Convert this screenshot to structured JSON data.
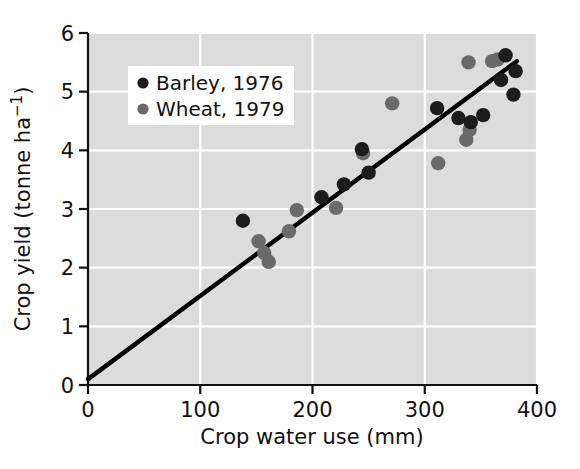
{
  "chart_data": {
    "type": "scatter",
    "title": "",
    "xlabel": "Crop water use (mm)",
    "ylabel": "Crop yield (tonne ha−1)",
    "xlim": [
      0,
      400
    ],
    "ylim": [
      0,
      6
    ],
    "xticks": [
      0,
      100,
      200,
      300,
      400
    ],
    "yticks": [
      0,
      1,
      2,
      3,
      4,
      5,
      6
    ],
    "xtick_labels": [
      "0",
      "100",
      "200",
      "300",
      "400"
    ],
    "ytick_labels": [
      "0",
      "1",
      "2",
      "3",
      "4",
      "5",
      "6"
    ],
    "grid": true,
    "grid_color": "#ffffff",
    "plot_background": "#dcdcdc",
    "legend_position": "upper-left-inside",
    "series": [
      {
        "name": "Barley, 1976",
        "color": "#1c1c1c",
        "marker": "circle",
        "points": [
          [
            138,
            2.8
          ],
          [
            208,
            3.2
          ],
          [
            228,
            3.42
          ],
          [
            244,
            4.02
          ],
          [
            250,
            3.62
          ],
          [
            311,
            4.72
          ],
          [
            330,
            4.55
          ],
          [
            341,
            4.48
          ],
          [
            352,
            4.6
          ],
          [
            368,
            5.2
          ],
          [
            372,
            5.62
          ],
          [
            379,
            4.95
          ],
          [
            381,
            5.35
          ]
        ]
      },
      {
        "name": "Wheat, 1979",
        "color": "#6a6a6a",
        "marker": "circle",
        "points": [
          [
            152,
            2.45
          ],
          [
            157,
            2.25
          ],
          [
            161,
            2.1
          ],
          [
            179,
            2.62
          ],
          [
            186,
            2.98
          ],
          [
            221,
            3.02
          ],
          [
            245,
            3.95
          ],
          [
            271,
            4.8
          ],
          [
            312,
            3.78
          ],
          [
            337,
            4.18
          ],
          [
            339,
            5.5
          ],
          [
            340,
            4.35
          ],
          [
            360,
            5.52
          ],
          [
            365,
            5.55
          ]
        ]
      }
    ],
    "trendline": {
      "name": "linear fit",
      "color": "#000000",
      "x_start": 0,
      "y_start": 0.1,
      "x_end": 382,
      "y_end": 5.52
    }
  },
  "legend": {
    "entries": [
      {
        "label": "Barley, 1976",
        "color": "#1c1c1c"
      },
      {
        "label": "Wheat, 1979",
        "color": "#6a6a6a"
      }
    ]
  },
  "axes": {
    "x_title": "Crop water use (mm)",
    "y_title_main": "Crop yield (tonne ha",
    "y_title_exp": "−1",
    "y_title_close": ")"
  }
}
